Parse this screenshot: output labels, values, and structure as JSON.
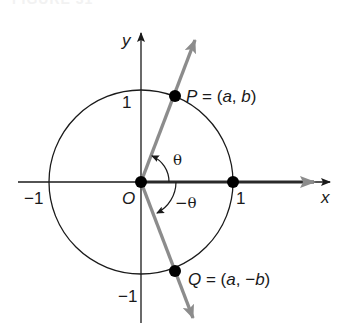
{
  "figure": {
    "caption": "FIGURE 31"
  },
  "axes": {
    "x_label": "x",
    "y_label": "y",
    "origin_label": "O",
    "ticks": {
      "x_pos": "1",
      "x_neg": "−1",
      "y_pos": "1",
      "y_neg": "−1"
    }
  },
  "points": {
    "P": {
      "name": "P",
      "label": "= (a, b)",
      "name_text": "P",
      "eq": " = (",
      "a": "a",
      "comma": ", ",
      "b": "b",
      "close": ")"
    },
    "Q": {
      "name": "Q",
      "name_text": "Q",
      "eq": " = (",
      "a": "a",
      "comma": ", ",
      "neg": "−",
      "b": "b",
      "close": ")"
    }
  },
  "angles": {
    "theta": "θ",
    "neg_theta": "−θ"
  },
  "colors": {
    "axis": "#1a1a1a",
    "circle": "#1a1a1a",
    "ray": "#8c8c8c",
    "initial_side": "#2a2a2a",
    "point": "#000000"
  },
  "geometry": {
    "center": [
      141,
      182
    ],
    "radius": 92,
    "theta_deg": 68
  }
}
